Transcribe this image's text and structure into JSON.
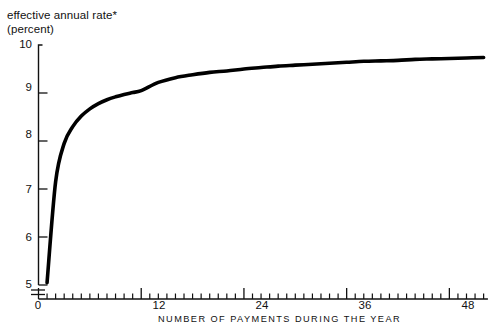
{
  "chart_data": {
    "type": "line",
    "title": "effective annual rate*",
    "subtitle": "(percent)",
    "xlabel": "NUMBER OF PAYMENTS DURING THE YEAR",
    "ylabel": "effective annual rate* (percent)",
    "x": [
      1,
      2,
      3,
      4,
      5,
      6,
      7,
      8,
      9,
      10,
      11,
      12,
      14,
      16,
      18,
      20,
      22,
      24,
      26,
      28,
      30,
      32,
      34,
      36,
      38,
      40,
      42,
      44,
      46,
      48,
      50,
      52
    ],
    "values": [
      5.05,
      7.15,
      7.95,
      8.3,
      8.52,
      8.67,
      8.78,
      8.86,
      8.92,
      8.97,
      9.01,
      9.05,
      9.22,
      9.32,
      9.38,
      9.43,
      9.46,
      9.5,
      9.53,
      9.56,
      9.58,
      9.6,
      9.62,
      9.64,
      9.66,
      9.67,
      9.68,
      9.7,
      9.71,
      9.72,
      9.73,
      9.74
    ],
    "series": [
      {
        "name": "effective annual rate",
        "values": [
          5.05,
          7.15,
          7.95,
          8.3,
          8.52,
          8.67,
          8.78,
          8.86,
          8.92,
          8.97,
          9.01,
          9.05,
          9.22,
          9.32,
          9.38,
          9.43,
          9.46,
          9.5,
          9.53,
          9.56,
          9.58,
          9.6,
          9.62,
          9.64,
          9.66,
          9.67,
          9.68,
          9.7,
          9.71,
          9.72,
          9.73,
          9.74
        ]
      }
    ],
    "xlim": [
      0,
      52
    ],
    "ylim": [
      5,
      10
    ],
    "y_ticks": [
      "10",
      "9",
      "8",
      "7",
      "6",
      "5"
    ],
    "y_tick_values": [
      10,
      9,
      8,
      7,
      6,
      5
    ],
    "x_ticks": [
      "0",
      "12",
      "24",
      "36",
      "48"
    ],
    "x_tick_values": [
      0,
      12,
      24,
      36,
      48
    ],
    "x_minor_tick_interval": 1,
    "grid": false,
    "legend": false,
    "legend_position": "none",
    "y_axis_break": true,
    "annotations": [
      "*"
    ],
    "line_color": "#000000",
    "background_color": "#ffffff"
  },
  "axes": {
    "y_title_line1": "effective annual rate*",
    "y_title_line2": "(percent)",
    "x_title": "NUMBER OF PAYMENTS DURING THE YEAR"
  },
  "y_tick_labels": [
    {
      "text": "10"
    },
    {
      "text": "9"
    },
    {
      "text": "8"
    },
    {
      "text": "7"
    },
    {
      "text": "6"
    },
    {
      "text": "5"
    }
  ],
  "x_tick_labels": [
    {
      "text": "0"
    },
    {
      "text": "12"
    },
    {
      "text": "24"
    },
    {
      "text": "36"
    },
    {
      "text": "48"
    }
  ]
}
